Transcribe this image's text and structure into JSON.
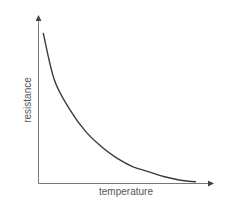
{
  "chart_data": {
    "type": "line",
    "title": "",
    "xlabel": "temperature",
    "ylabel": "resistance",
    "grid": false,
    "legend": null,
    "ticks": false,
    "series": [
      {
        "name": "resistance",
        "color": "#3a3a3a",
        "x": [
          0.03,
          0.1,
          0.2,
          0.3,
          0.4,
          0.5,
          0.6,
          0.7,
          0.8,
          0.9,
          1.0
        ],
        "y": [
          0.9,
          0.62,
          0.44,
          0.31,
          0.22,
          0.15,
          0.1,
          0.07,
          0.04,
          0.02,
          0.01
        ]
      }
    ],
    "xlim": [
      0,
      1
    ],
    "ylim": [
      0,
      1
    ]
  },
  "colors": {
    "axis": "#555555",
    "curve": "#3a3a3a",
    "label": "#555555",
    "background": "#ffffff"
  }
}
